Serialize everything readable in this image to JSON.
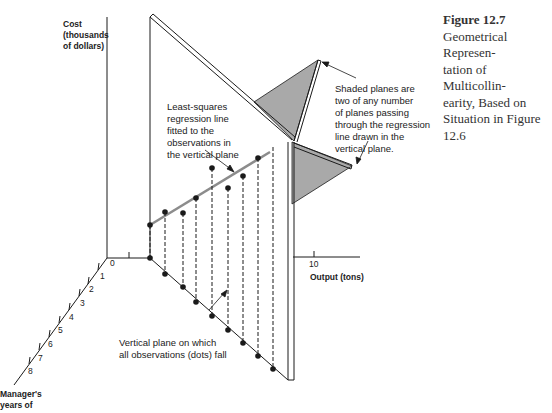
{
  "figure": {
    "number_label": "Figure 12.7",
    "caption": "Geometrical Representation of Multicollinearity, Based on Situation in Figure 12.6",
    "caption_lines": [
      "Geometrical Represen-",
      "tation of Multicollin-",
      "earity, Based on",
      "Situation in Figure",
      "12.6"
    ]
  },
  "axes": {
    "cost": {
      "label_lines": [
        "Cost",
        "(thousands",
        "of dollars)"
      ]
    },
    "output": {
      "label": "Output (tons)",
      "ticks": [
        "10"
      ]
    },
    "manager": {
      "label_lines": [
        "Manager's",
        "years of"
      ],
      "ticks": [
        "0",
        "1",
        "2",
        "3",
        "4",
        "5",
        "6",
        "7",
        "8"
      ]
    }
  },
  "annotations": {
    "regression": {
      "lines": [
        "Least-squares",
        "regression line",
        "fitted to the",
        "observations in",
        "the vertical plane"
      ]
    },
    "shaded": {
      "lines": [
        "Shaded planes are",
        "two of any number",
        "of planes passing",
        "through the regression",
        "line drawn in the",
        "vertical plane."
      ]
    },
    "vertical": {
      "lines": [
        "Vertical plane on which",
        "all observations (dots) fall"
      ]
    }
  },
  "colors": {
    "shade": "#a9a9a9",
    "line": "#1a1a1a",
    "regression": "#8c8c8c"
  }
}
